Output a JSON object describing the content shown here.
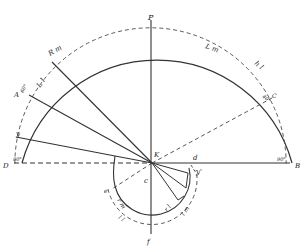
{
  "diagram": {
    "title": "",
    "center": {
      "label": "K"
    },
    "points": {
      "top": "P",
      "right": "B",
      "left": "D",
      "bottom": "f",
      "c_center": "c",
      "d": "d",
      "y_left": "y",
      "y_right": "y'",
      "C_right": "C",
      "A_left": "A",
      "e_left": "e"
    },
    "arc_labels": {
      "L_m": "L m",
      "h_l": "h l",
      "R_m": "R m",
      "L_l": "L l",
      "r_m": "r m",
      "l_l": "l l",
      "r_l": "r l",
      "l_m": "l m"
    },
    "angle_labels": {
      "left_90": "90°",
      "right_90": "90°",
      "c_angle": "40°",
      "a_angle": "60°"
    },
    "colors": {
      "line": "#333333",
      "background": "#ffffff"
    }
  }
}
